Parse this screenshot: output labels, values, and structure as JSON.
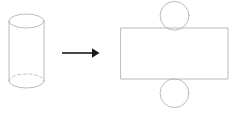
{
  "canvas": {
    "width": 235,
    "height": 113,
    "background_color": "#ffffff"
  },
  "diagram": {
    "stroke_color": "#b3b3b3",
    "hidden_edge_color": "#bdbdbd",
    "arrow_color": "#1a1a1a",
    "stroke_width": 0.9,
    "arrow_stroke_width": 1.6,
    "dash_pattern": "3,2.6"
  },
  "solid": {
    "name": "cylinder",
    "label": "cylinder",
    "top_ellipse": {
      "cx": 26.5,
      "cy": 21.0,
      "rx": 17.5,
      "ry": 7.0
    },
    "bottom_ellipse": {
      "cx": 26.5,
      "cy": 81.0,
      "rx": 17.5,
      "ry": 7.0
    },
    "left_side": {
      "x": 9.0,
      "y1": 21.0,
      "y2": 81.0
    },
    "right_side": {
      "x": 44.0,
      "y1": 21.0,
      "y2": 81.0
    },
    "front_bottom_arc": "M 9 81 A 17.5 7 0 0 0 44 81",
    "hidden_bottom_arc": "M 9 81 A 17.5 7 0 0 1 44 81"
  },
  "arrow": {
    "name": "transformation-arrow",
    "label": "unfolds into",
    "shaft": {
      "x1": 62.0,
      "y1": 53.0,
      "x2": 92.0,
      "y2": 53.0
    },
    "head": "92,48.2 99.5,53 92,57.8"
  },
  "net": {
    "name": "cylinder-net",
    "label": "net of cylinder",
    "lateral_rectangle": {
      "x": 121.0,
      "y": 28.0,
      "width": 107.0,
      "height": 51.0
    },
    "top_circle": {
      "cx": 174.5,
      "cy": 15.8,
      "r": 14.4,
      "label": "top base circle"
    },
    "bottom_circle": {
      "cx": 174.5,
      "cy": 93.2,
      "r": 14.4,
      "label": "bottom base circle"
    }
  }
}
